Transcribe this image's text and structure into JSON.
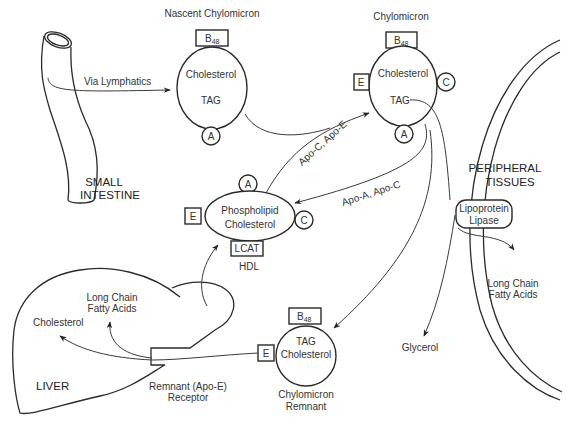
{
  "diagram": {
    "small_intestine": {
      "line1": "SMALL",
      "line2": "INTESTINE"
    },
    "via_lymphatics": "Via Lymphatics",
    "nascent_chylomicron": {
      "title": "Nascent Chylomicron",
      "apo_top": "B",
      "apo_top_sub": "48",
      "line1": "Cholesterol",
      "line2": "TAG",
      "apo_bottom": "A"
    },
    "chylomicron": {
      "title": "Chylomicron",
      "apo_top": "B",
      "apo_top_sub": "48",
      "line1": "Cholesterol",
      "line2": "TAG",
      "apo_left": "E",
      "apo_right": "C",
      "apo_bottom": "A"
    },
    "hdl": {
      "title": "HDL",
      "line1": "Phospholipid",
      "line2": "Cholesterol",
      "apo_top": "A",
      "apo_left": "E",
      "apo_right": "C",
      "apo_bottom": "LCAT"
    },
    "transfer_to_chylomicron": "Apo-C, Apo-E",
    "transfer_to_hdl": "Apo-A, Apo-C",
    "peripheral_tissues": {
      "line1": "PERIPHERAL",
      "line2": "TISSUES"
    },
    "lipoprotein_lipase": {
      "line1": "Lipoprotein",
      "line2": "Lipase"
    },
    "peripheral_fatty_acids": {
      "line1": "Long Chain",
      "line2": "Fatty Acids"
    },
    "glycerol": "Glycerol",
    "chylomicron_remnant": {
      "title_line1": "Chylomicron",
      "title_line2": "Remnant",
      "apo_top": "B",
      "apo_top_sub": "48",
      "line1": "TAG",
      "line2": "Cholesterol",
      "apo_left": "E"
    },
    "liver": {
      "label": "LIVER",
      "cholesterol": "Cholesterol",
      "fatty_acids_line1": "Long Chain",
      "fatty_acids_line2": "Fatty Acids",
      "receptor_line1": "Remnant (Apo-E)",
      "receptor_line2": "Receptor"
    }
  }
}
